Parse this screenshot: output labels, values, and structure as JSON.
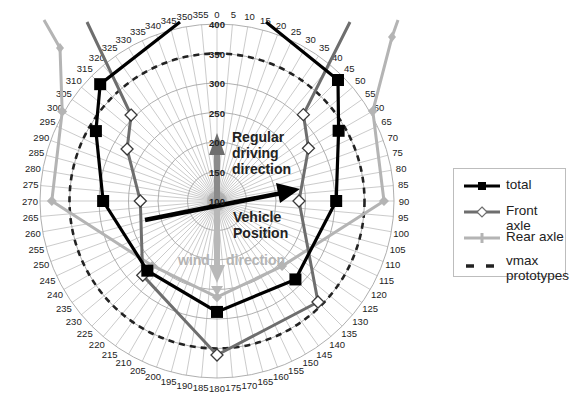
{
  "chart_data": {
    "type": "polar-line",
    "title": "",
    "center": [
      217,
      201
    ],
    "radial_axis": {
      "min": 100,
      "max": 400,
      "ticks": [
        100,
        150,
        200,
        250,
        300,
        350,
        400
      ],
      "tick_labels": [
        "100",
        "150",
        "200",
        "250",
        "300",
        "350",
        "400"
      ]
    },
    "angular_axis": {
      "step_degrees": 5,
      "tick_labels": [
        "0",
        "5",
        "10",
        "15",
        "20",
        "25",
        "30",
        "35",
        "40",
        "45",
        "50",
        "55",
        "60",
        "65",
        "70",
        "75",
        "80",
        "85",
        "90",
        "95",
        "100",
        "105",
        "110",
        "115",
        "120",
        "125",
        "130",
        "135",
        "140",
        "145",
        "150",
        "155",
        "160",
        "165",
        "170",
        "175",
        "180",
        "185",
        "190",
        "195",
        "200",
        "205",
        "210",
        "215",
        "220",
        "225",
        "230",
        "235",
        "240",
        "245",
        "250",
        "255",
        "260",
        "265",
        "270",
        "275",
        "280",
        "285",
        "290",
        "295",
        "300",
        "305",
        "310",
        "315",
        "320",
        "325",
        "330",
        "335",
        "340",
        "345",
        "350",
        "355"
      ]
    },
    "grid": true,
    "series": [
      {
        "name": "total",
        "color": "#000000",
        "marker": "square",
        "points": [
          {
            "angle": 45,
            "value": 390
          },
          {
            "angle": 60,
            "value": 338
          },
          {
            "angle": 90,
            "value": 302
          },
          {
            "angle": 135,
            "value": 288
          },
          {
            "angle": 180,
            "value": 288
          },
          {
            "angle": 225,
            "value": 267
          },
          {
            "angle": 270,
            "value": 293
          },
          {
            "angle": 300,
            "value": 337
          },
          {
            "angle": 315,
            "value": 380
          }
        ],
        "extends_beyond_axis": true
      },
      {
        "name": "Front axle",
        "color": "#6e6e6e",
        "marker": "diamond-open",
        "points": [
          {
            "angle": 45,
            "value": 307
          },
          {
            "angle": 60,
            "value": 279
          },
          {
            "angle": 90,
            "value": 239
          },
          {
            "angle": 135,
            "value": 342
          },
          {
            "angle": 180,
            "value": 361
          },
          {
            "angle": 225,
            "value": 278
          },
          {
            "angle": 270,
            "value": 230
          },
          {
            "angle": 300,
            "value": 276
          },
          {
            "angle": 315,
            "value": 306
          }
        ],
        "extends_beyond_axis": true
      },
      {
        "name": "Rear axle",
        "color": "#b4b4b4",
        "marker": "plus",
        "points": [
          {
            "angle": 60,
            "value": 405
          },
          {
            "angle": 90,
            "value": 383
          },
          {
            "angle": 135,
            "value": 256
          },
          {
            "angle": 180,
            "value": 263
          },
          {
            "angle": 225,
            "value": 255
          },
          {
            "angle": 270,
            "value": 380
          },
          {
            "angle": 300,
            "value": 403
          }
        ],
        "extends_beyond_axis": true
      },
      {
        "name": "vmax prototypes",
        "color": "#222222",
        "style": "dashed-circle",
        "value": 350
      }
    ],
    "annotations": [
      {
        "text_lines": [
          "Regular",
          "driving",
          "direction"
        ],
        "style": "dark"
      },
      {
        "text_lines": [
          "Vehicle",
          "Position"
        ],
        "style": "dark"
      },
      {
        "text": "wind – direction",
        "style": "light"
      }
    ],
    "legend": {
      "position": "right",
      "entries": [
        "total",
        "Front axle",
        "Rear axle",
        "vmax prototypes"
      ]
    }
  },
  "annotations": {
    "regular_line1": "Regular",
    "regular_line2": "driving",
    "regular_line3": "direction",
    "vehicle_line1": "Vehicle",
    "vehicle_line2": "Position",
    "wind_left": "wind",
    "wind_right": "direction"
  },
  "legend": {
    "items": [
      {
        "label": "total"
      },
      {
        "label": "Front axle"
      },
      {
        "label": "Rear axle"
      },
      {
        "label": "vmax\nprototypes"
      }
    ]
  }
}
